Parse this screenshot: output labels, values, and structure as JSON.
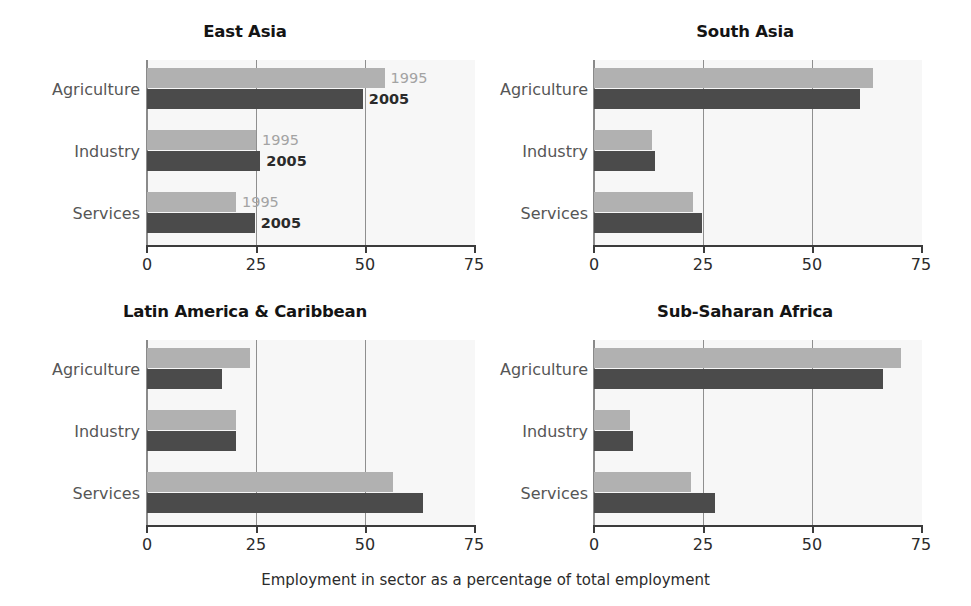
{
  "chart_data": {
    "type": "bar",
    "orientation": "horizontal",
    "title": "",
    "xlabel": "Employment in sector as a percentage of total employment",
    "ylabel": "",
    "xlim": [
      0,
      75
    ],
    "xticks": [
      0,
      25,
      50,
      75
    ],
    "xtick_labels": [
      "0",
      "25",
      "50",
      "75"
    ],
    "grid": "vertical gridlines at 25 and 50",
    "legend": {
      "position": "inline annotations on first panel only",
      "entries": [
        "1995",
        "2005"
      ]
    },
    "categories": [
      "Agriculture",
      "Industry",
      "Services"
    ],
    "series": [
      {
        "name": "1995",
        "color": "#b1b1b1"
      },
      {
        "name": "2005",
        "color": "#4b4b4b"
      }
    ],
    "panels": [
      {
        "title": "East Asia",
        "annotated": true,
        "values": {
          "1995": [
            54.5,
            25.0,
            20.4
          ],
          "2005": [
            49.5,
            26.0,
            24.7
          ]
        }
      },
      {
        "title": "South Asia",
        "annotated": false,
        "values": {
          "1995": [
            64.0,
            13.2,
            22.7
          ],
          "2005": [
            61.0,
            13.9,
            24.8
          ]
        }
      },
      {
        "title": "Latin America & Caribbean",
        "annotated": false,
        "values": {
          "1995": [
            23.6,
            20.3,
            56.4
          ],
          "2005": [
            17.2,
            20.5,
            63.2
          ]
        }
      },
      {
        "title": "Sub-Saharan Africa",
        "annotated": false,
        "values": {
          "1995": [
            70.5,
            8.3,
            22.2
          ],
          "2005": [
            66.2,
            8.9,
            27.7
          ]
        }
      }
    ]
  },
  "figure": {
    "xaxis_title": "Employment in sector as a percentage of total employment",
    "panel_titles": [
      "East Asia",
      "South Asia",
      "Latin America & Caribbean",
      "Sub-Saharan Africa"
    ],
    "category_labels": [
      "Agriculture",
      "Industry",
      "Services"
    ],
    "tick_labels": [
      "0",
      "25",
      "50",
      "75"
    ],
    "series_labels": [
      "1995",
      "2005"
    ],
    "colors": {
      "series_1995": "#b1b1b1",
      "series_2005": "#4b4b4b",
      "plot_background": "#f7f7f7",
      "gridline": "#8f8f8f",
      "axis": "#3c3c3c",
      "title_text": "#141414",
      "category_text": "#565656"
    }
  }
}
